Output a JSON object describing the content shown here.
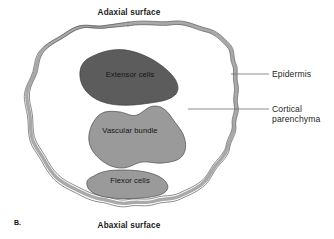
{
  "figure": {
    "panel_label": "B.",
    "surfaces": {
      "top": "Adaxial surface",
      "bottom": "Abaxial surface"
    },
    "callouts": [
      {
        "label": "Epidermis"
      },
      {
        "label_line1": "Cortical",
        "label_line2": "parenchyma"
      }
    ],
    "regions": [
      {
        "name": "Extensor cells",
        "fill": "#5c5c5c"
      },
      {
        "name": "Vascular bundle",
        "fill": "#9a9a9a"
      },
      {
        "name": "Flexor cells",
        "fill": "#9a9a9a"
      }
    ],
    "colors": {
      "background": "#ffffff",
      "outline_band": "#a8a8a8",
      "outline_stroke": "#595959",
      "shape_stroke": "#4a4a4a",
      "leader_line": "#6e6e6e",
      "text": "#1a1a1a"
    }
  }
}
